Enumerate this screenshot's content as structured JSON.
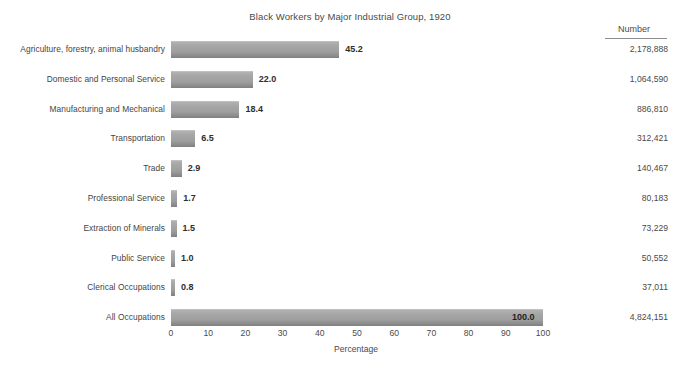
{
  "chart_data": {
    "type": "bar",
    "orientation": "horizontal",
    "title": "Black Workers by Major Industrial Group, 1920",
    "xlabel": "Percentage",
    "ylabel": "",
    "xlim": [
      0,
      100
    ],
    "xticks": [
      0,
      10,
      20,
      30,
      40,
      50,
      60,
      70,
      80,
      90,
      100
    ],
    "grid": false,
    "legend": "none",
    "bar_color": "#9e9e9e",
    "categories": [
      "Agriculture, forestry, animal husbandry",
      "Domestic and Personal Service",
      "Manufacturing and Mechanical",
      "Transportation",
      "Trade",
      "Professional Service",
      "Extraction of Minerals",
      "Public Service",
      "Clerical Occupations",
      "All Occupations"
    ],
    "values": [
      45.2,
      22.0,
      18.4,
      6.5,
      2.9,
      1.7,
      1.5,
      1.0,
      0.8,
      100.0
    ],
    "value_labels": [
      "45.2",
      "22.0",
      "18.4",
      "6.5",
      "2.9",
      "1.7",
      "1.5",
      "1.0",
      "0.8",
      "100.0"
    ],
    "numbers": [
      "2,178,888",
      "1,064,590",
      "886,810",
      "312,421",
      "140,467",
      "80,183",
      "73,229",
      "50,552",
      "37,011",
      "4,824,151"
    ],
    "number_column_header": "Number"
  },
  "rows": [
    {
      "category": "Agriculture, forestry, animal husbandry",
      "value": 45.2,
      "value_label": "45.2",
      "number": "2,178,888"
    },
    {
      "category": "Domestic and Personal Service",
      "value": 22.0,
      "value_label": "22.0",
      "number": "1,064,590"
    },
    {
      "category": "Manufacturing and Mechanical",
      "value": 18.4,
      "value_label": "18.4",
      "number": "886,810"
    },
    {
      "category": "Transportation",
      "value": 6.5,
      "value_label": "6.5",
      "number": "312,421"
    },
    {
      "category": "Trade",
      "value": 2.9,
      "value_label": "2.9",
      "number": "140,467"
    },
    {
      "category": "Professional Service",
      "value": 1.7,
      "value_label": "1.7",
      "number": "80,183"
    },
    {
      "category": "Extraction of Minerals",
      "value": 1.5,
      "value_label": "1.5",
      "number": "73,229"
    },
    {
      "category": "Public Service",
      "value": 1.0,
      "value_label": "1.0",
      "number": "50,552"
    },
    {
      "category": "Clerical Occupations",
      "value": 0.8,
      "value_label": "0.8",
      "number": "37,011"
    },
    {
      "category": "All Occupations",
      "value": 100.0,
      "value_label": "100.0",
      "number": "4,824,151"
    }
  ],
  "axis": {
    "ticks": [
      "0",
      "10",
      "20",
      "30",
      "40",
      "50",
      "60",
      "70",
      "80",
      "90",
      "100"
    ],
    "title": "Percentage"
  },
  "colors": {
    "bar_top": "#b2b2b2",
    "bar_bottom": "#808080",
    "text": "#454545",
    "rule": "#8d8d8d",
    "background": "#ffffff"
  }
}
